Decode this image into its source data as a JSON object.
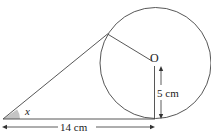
{
  "diagram": {
    "labels": {
      "center": "O",
      "radius": "5 cm",
      "base": "14 cm",
      "angle": "x"
    },
    "colors": {
      "stroke": "#333333",
      "angle_fill": "#bdbdbd",
      "background": "#ffffff"
    }
  }
}
